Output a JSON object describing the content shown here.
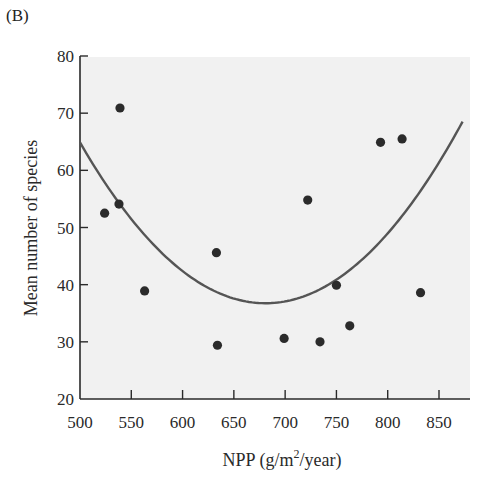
{
  "panel_label": "(B)",
  "chart_data": {
    "type": "scatter",
    "title": "",
    "xlabel": "NPP (g/m²/year)",
    "xlabel_parts": {
      "pre": "NPP (g/m",
      "sup": "2",
      "post": "/year)"
    },
    "ylabel": "Mean number of species",
    "xlim": [
      500,
      875
    ],
    "ylim": [
      20,
      80
    ],
    "xticks": [
      500,
      550,
      600,
      650,
      700,
      750,
      800,
      850
    ],
    "yticks": [
      20,
      30,
      40,
      50,
      60,
      70,
      80
    ],
    "grid": false,
    "legend": null,
    "points": [
      {
        "x": 524,
        "y": 52.5
      },
      {
        "x": 538,
        "y": 54.1
      },
      {
        "x": 539,
        "y": 70.9
      },
      {
        "x": 563,
        "y": 38.9
      },
      {
        "x": 633,
        "y": 45.6
      },
      {
        "x": 634,
        "y": 29.4
      },
      {
        "x": 699,
        "y": 30.6
      },
      {
        "x": 722,
        "y": 54.8
      },
      {
        "x": 734,
        "y": 30.0
      },
      {
        "x": 750,
        "y": 39.9
      },
      {
        "x": 763,
        "y": 32.8
      },
      {
        "x": 793,
        "y": 64.9
      },
      {
        "x": 814,
        "y": 65.5
      },
      {
        "x": 832,
        "y": 38.6
      }
    ],
    "fit_curve": {
      "type": "quadratic",
      "description": "U-shaped fitted curve",
      "samples": [
        {
          "x": 500,
          "y": 64.6
        },
        {
          "x": 550,
          "y": 51.5
        },
        {
          "x": 600,
          "y": 42.9
        },
        {
          "x": 650,
          "y": 37.8
        },
        {
          "x": 675,
          "y": 36.6
        },
        {
          "x": 700,
          "y": 37.0
        },
        {
          "x": 750,
          "y": 40.8
        },
        {
          "x": 800,
          "y": 48.6
        },
        {
          "x": 850,
          "y": 61.0
        },
        {
          "x": 873,
          "y": 69.1
        }
      ]
    },
    "colors": {
      "plot_bg": "#f1f1f1",
      "marker": "#2b2b2b",
      "curve": "#555555",
      "axis": "#2a2a2a"
    }
  }
}
